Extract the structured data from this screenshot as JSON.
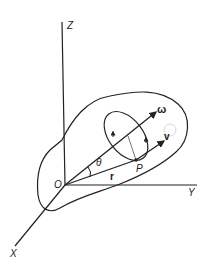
{
  "diagram": {
    "type": "rigid-body-rotation",
    "axes": {
      "z_label": "Z",
      "y_label": "Y",
      "x_label": "X"
    },
    "origin_label": "O",
    "point_label": "P",
    "vectors": {
      "omega_label": "ω",
      "velocity_label": "v",
      "position_label": "r"
    },
    "angle_label": "θ",
    "colors": {
      "stroke": "#222222",
      "background": "#ffffff"
    }
  }
}
